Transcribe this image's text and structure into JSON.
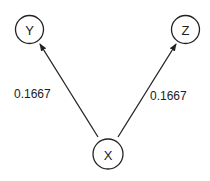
{
  "diagram": {
    "type": "directed-graph",
    "nodes": [
      {
        "id": "Y",
        "label": "Y",
        "cx": 29.5,
        "cy": 29.5,
        "r": 14
      },
      {
        "id": "Z",
        "label": "Z",
        "cx": 185.5,
        "cy": 29.5,
        "r": 14
      },
      {
        "id": "X",
        "label": "X",
        "cx": 108,
        "cy": 154,
        "r": 15
      }
    ],
    "edges": [
      {
        "from": "X",
        "to": "Y",
        "label": "0.1667",
        "label_x": 14,
        "label_y": 98
      },
      {
        "from": "X",
        "to": "Z",
        "label": "0.1667",
        "label_x": 150,
        "label_y": 100
      }
    ],
    "colors": {
      "stroke": "#222222",
      "background": "#ffffff"
    }
  }
}
